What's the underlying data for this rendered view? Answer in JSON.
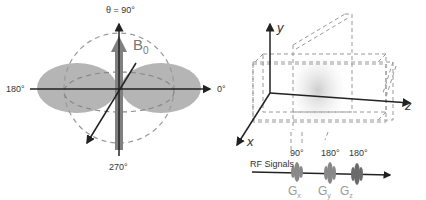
{
  "left_diagram": {
    "theta_label": "θ = 90°",
    "left_label": "180°",
    "right_label": "0°",
    "bottom_label": "270°",
    "field_label": "B",
    "field_subscript": "0"
  },
  "right_diagram": {
    "axes": {
      "x": "x",
      "y": "y",
      "z": "z"
    },
    "rf_label": "RF Signals",
    "pulses": [
      {
        "angle": "90°",
        "gradient": "G",
        "sub": "x"
      },
      {
        "angle": "180°",
        "gradient": "G",
        "sub": "y"
      },
      {
        "angle": "180°",
        "gradient": "G",
        "sub": "z"
      }
    ]
  },
  "colors": {
    "lobe": "#a8a8a8",
    "dashed": "#999999",
    "axis": "#222222",
    "arrow": "#808080"
  }
}
